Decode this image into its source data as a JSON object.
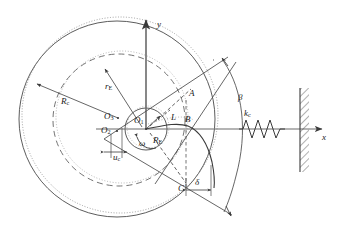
{
  "figure": {
    "background_color": "#ffffff",
    "line_color": "#404040",
    "axis_color": "#555555",
    "dash_color": "#606060",
    "width": 340,
    "height": 240
  },
  "axes": {
    "x_label": "x",
    "y_label": "y",
    "origin_label": "O"
  },
  "labels": {
    "outer_radius": "R",
    "outer_radius_sub": "c",
    "inner_radius_r": "r",
    "inner_radius_r_sub": "E",
    "roller_radius": "R",
    "roller_radius_sub": "E",
    "center_o1": "O",
    "center_o1_sub": "1",
    "center_o2": "O",
    "center_o2_sub": "2",
    "center_o3": "O",
    "center_o3_sub": "3",
    "offset_u": "u",
    "offset_u_sub": "c",
    "length_L": "L",
    "omega": "ω",
    "beta": "β",
    "delta": "δ",
    "spring_k": "k",
    "spring_k_sub": "c",
    "point_a": "A",
    "point_b": "B",
    "point_c": "C"
  },
  "elements": {
    "spring_name": "coil-spring",
    "wall_name": "fixed-wall-hatching",
    "arc_beta_name": "angle-beta-arc",
    "dimension_delta_name": "dimension-delta",
    "dimension_u_name": "dimension-u-c"
  }
}
